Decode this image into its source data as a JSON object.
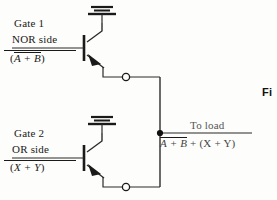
{
  "figure": {
    "type": "circuit-schematic"
  },
  "gate1": {
    "title": "Gate 1",
    "side": "NOR side",
    "expr_open": "(",
    "expr_overlined": "A + B",
    "expr_close": ")",
    "symbol": "npn-transistor",
    "ground": "ground-symbol",
    "terminal": "open-terminal-node"
  },
  "gate2": {
    "title": "Gate 2",
    "side": "OR side",
    "expr_open": "(",
    "expr_plain": "X + Y",
    "expr_close": ")",
    "symbol": "npn-transistor",
    "ground": "ground-symbol",
    "terminal": "open-terminal-node"
  },
  "output": {
    "caption": "To load",
    "expr_overlined": "A + B",
    "expr_tail": " + (X + Y)",
    "junction": "wired-or-junction-dot"
  },
  "caption": {
    "text": "Fi"
  },
  "colors": {
    "ink": "#1a1a1a",
    "wire": "#2b2b2b",
    "muted": "#555555",
    "paper": "#fdfdfb"
  }
}
